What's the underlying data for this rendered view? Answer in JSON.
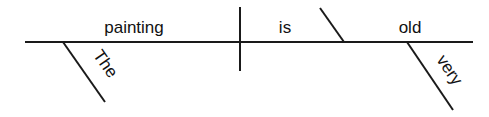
{
  "diagram": {
    "type": "sentence-diagram",
    "sentence": "The painting is very old",
    "subject": "painting",
    "verb": "is",
    "predicate_adjective": "old",
    "modifiers": [
      {
        "word": "The",
        "modifies": "painting"
      },
      {
        "word": "very",
        "modifies": "old"
      }
    ],
    "line_color": "#1a1a1a",
    "text_color": "#111111"
  }
}
